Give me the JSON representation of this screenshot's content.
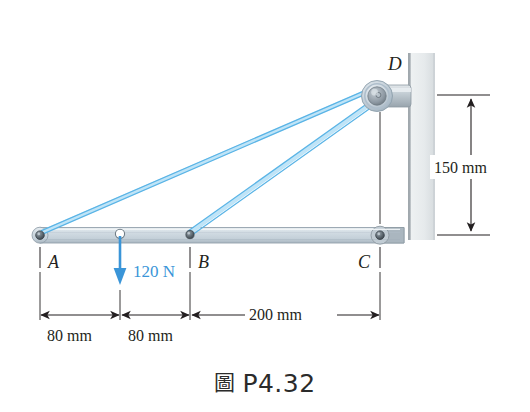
{
  "figure": {
    "caption_glyph": "圖",
    "caption_text": "P4.32",
    "caption_glyph_name": "figure-cjk-glyph"
  },
  "colors": {
    "cable": "#5ab4e6",
    "cable_highlight": "#bfe4f7",
    "force_arrow": "#3a95d8",
    "force_label": "#3a95d8",
    "beam_fill": "#cfd9e0",
    "beam_edge": "#8c9aa6",
    "pin_dark": "#4f5a63",
    "wall_fill": "#e9ecee",
    "wall_edge": "#9aa2a8",
    "bracket_fill": "#b9c2c8",
    "pulley_outer": "#c3cdd6",
    "pulley_inner": "#8e99a3",
    "ink": "#231f20"
  },
  "points": {
    "A": {
      "label": "A",
      "x": 40,
      "y": 235
    },
    "B": {
      "label": "B",
      "x": 190,
      "y": 235
    },
    "C": {
      "label": "C",
      "x": 380,
      "y": 235
    },
    "D": {
      "label": "D",
      "x": 378,
      "y": 95
    },
    "load_point": {
      "x": 120,
      "y": 234
    }
  },
  "load": {
    "magnitude": "120 N",
    "direction": "down",
    "applied_at": "between A and B"
  },
  "dimensions": {
    "horizontal": [
      {
        "label": "80 mm",
        "from": "A",
        "to": "load point",
        "x_start": 40,
        "x_end": 120
      },
      {
        "label": "80 mm",
        "from": "load point",
        "to": "B",
        "x_start": 120,
        "x_end": 190
      },
      {
        "label": "200 mm",
        "from": "B",
        "to": "C",
        "x_start": 190,
        "x_end": 380
      }
    ],
    "vertical": [
      {
        "label": "150 mm",
        "from": "D level",
        "to": "C level",
        "y_top": 95,
        "y_bottom": 235
      }
    ]
  },
  "members": {
    "beam": {
      "name": "beam ABC",
      "from": "A",
      "to": "wall at C"
    },
    "cable_AD": {
      "name": "cable A to D",
      "from": "A",
      "to": "D"
    },
    "cable_BD": {
      "name": "cable B to D",
      "from": "B",
      "to": "D"
    },
    "pulley_D": {
      "name": "pulley at D"
    },
    "bracket_D": {
      "name": "wall bracket at D"
    },
    "wall": {
      "name": "vertical wall"
    }
  }
}
